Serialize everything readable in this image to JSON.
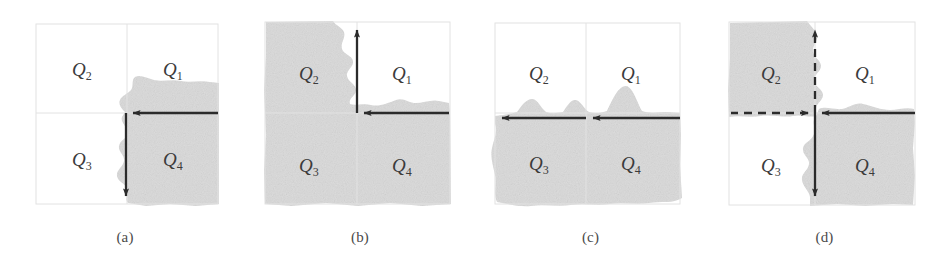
{
  "figure": {
    "background_color": "#ffffff",
    "shade_color": "#dcdcdc",
    "border_color": "#e2e2e2",
    "axis_color": "#2b2b2b",
    "label_color": "#3b3b3b",
    "quadrant_labels": [
      "Q1",
      "Q2",
      "Q3",
      "Q4"
    ],
    "quadrant_label_text": {
      "q1_base": "Q",
      "q1_sub": "1",
      "q2_base": "Q",
      "q2_sub": "2",
      "q3_base": "Q",
      "q3_sub": "3",
      "q4_base": "Q",
      "q4_sub": "4"
    },
    "panels": [
      {
        "id": "a",
        "caption": "(a)",
        "shaded_quadrants": [
          "Q4"
        ],
        "arrows": [
          {
            "direction": "left",
            "style": "solid",
            "axis": "horizontal"
          },
          {
            "direction": "down",
            "style": "solid",
            "axis": "vertical"
          }
        ]
      },
      {
        "id": "b",
        "caption": "(b)",
        "shaded_quadrants": [
          "Q2",
          "Q3",
          "Q4"
        ],
        "arrows": [
          {
            "direction": "up",
            "style": "solid",
            "axis": "vertical"
          },
          {
            "direction": "left",
            "style": "solid",
            "axis": "horizontal"
          }
        ]
      },
      {
        "id": "c",
        "caption": "(c)",
        "shaded_quadrants": [
          "Q3",
          "Q4"
        ],
        "arrows": [
          {
            "direction": "left",
            "style": "solid",
            "axis": "horizontal"
          },
          {
            "direction": "left",
            "style": "solid",
            "axis": "horizontal"
          }
        ]
      },
      {
        "id": "d",
        "caption": "(d)",
        "shaded_quadrants": [
          "Q2",
          "Q4"
        ],
        "arrows": [
          {
            "direction": "up",
            "style": "dashed",
            "axis": "vertical"
          },
          {
            "direction": "left",
            "style": "dashed",
            "axis": "horizontal"
          },
          {
            "direction": "down",
            "style": "solid",
            "axis": "vertical"
          },
          {
            "direction": "right",
            "style": "solid",
            "axis": "horizontal"
          }
        ]
      }
    ]
  }
}
